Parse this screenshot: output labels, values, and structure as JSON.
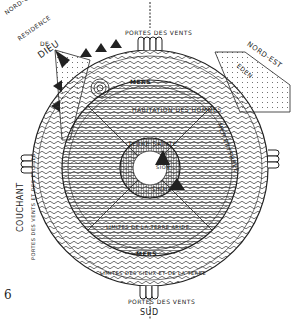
{
  "figure": {
    "number": "6",
    "labels": {
      "north_gate": "PORTES DES VENTS",
      "south_gate": "PORTES DES VENTS",
      "south": "SUD",
      "west": "COUCHANT",
      "west_gate": "PORTES DES VENTS ET DES ETOILES",
      "northwest": "NORD-OUEST",
      "residence": "RESIDENCE",
      "de": "DE",
      "dieu": "DIEU",
      "northeast": "NORD-EST",
      "eden": "EDEN",
      "jardin": "JARDIN DE JUSTICE",
      "mers_top": "MERS",
      "mers_bottom": "MERS",
      "mer_erythree": "MER ERYTHREE",
      "mer_occident": "MER DE L'OCCIDENT",
      "habitation": "HABITATION DES HOMMES",
      "hommes_avant": "HOMMES AVANT LE DELUGE",
      "terre_sainte": "TERRE SAINTE",
      "sion": "SION",
      "sinai": "SINAI",
      "limites_terre": "LIMITES DE LA TERRE ARIDE",
      "limites_cieux": "LIMITES DES CIEUX ET DE LA TERRE",
      "montagnes": "MONTAGNES"
    }
  }
}
